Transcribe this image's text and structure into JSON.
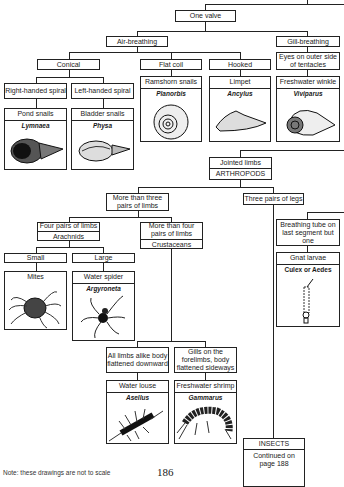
{
  "molluscs": {
    "one_valve": "One valve",
    "air_breathing": "Air-breathing",
    "gill_breathing": "Gill-breathing",
    "conical": "Conical",
    "flat_coil": "Flat coil",
    "hooked": "Hooked",
    "eyes_outer": "Eyes on outer side of tentacles",
    "right_handed": "Right-handed spiral",
    "left_handed": "Left-handed spiral",
    "cards": [
      {
        "common": "Pond snails",
        "latin": "Lymnaea",
        "icon": "pond-snail-drawing"
      },
      {
        "common": "Bladder snails",
        "latin": "Physa",
        "icon": "bladder-snail-drawing"
      },
      {
        "common": "Ramshorn snails",
        "latin": "Planorbis",
        "icon": "ramshorn-snail-drawing"
      },
      {
        "common": "Limpet",
        "latin": "Ancylus",
        "icon": "limpet-drawing"
      },
      {
        "common": "Freshwater winkle",
        "latin": "Viviparus",
        "icon": "winkle-drawing"
      }
    ]
  },
  "arthropods": {
    "jointed_limbs": "Jointed limbs",
    "arthropods_label": "ARTHROPODS",
    "more_than_three": "More than three pairs of limbs",
    "three_pairs": "Three pairs of legs",
    "four_pairs": "Four pairs of limbs",
    "arachnids": "Arachnids",
    "more_than_four": "More than four pairs of limbs",
    "crustaceans": "Crustaceans",
    "small": "Small",
    "large": "Large",
    "breathing_tube": "Breathing tube on last segment but one",
    "all_limbs_alike": "All limbs alike body flattened downward",
    "gills_forelimbs": "Gills on the forelimbs, body flattened sideways",
    "cards": [
      {
        "common": "Mites",
        "latin": "",
        "icon": "mite-drawing"
      },
      {
        "common": "Water spider",
        "latin": "Argyroneta",
        "icon": "water-spider-drawing"
      },
      {
        "common": "Gnat larvae",
        "latin": "Culex or Aedes",
        "icon": "gnat-larva-drawing"
      },
      {
        "common": "Water louse",
        "latin": "Asellus",
        "icon": "water-louse-drawing"
      },
      {
        "common": "Freshwater shrimp",
        "latin": "Gammarus",
        "icon": "freshwater-shrimp-drawing"
      }
    ],
    "insects": "INSECTS",
    "continued": "Continued on page 188"
  },
  "footer": {
    "note": "Note: these drawings are not to scale",
    "page_number": "186"
  }
}
